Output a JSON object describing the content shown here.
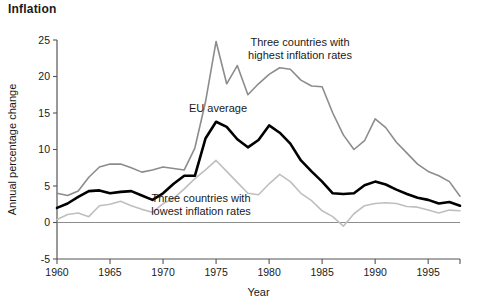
{
  "chart_data": {
    "type": "line",
    "title": "Inflation",
    "xlabel": "Year",
    "ylabel": "Annual percentage change",
    "xlim": [
      1960,
      1998
    ],
    "ylim": [
      -5,
      25
    ],
    "xticks": [
      1960,
      1965,
      1970,
      1975,
      1980,
      1985,
      1990,
      1995
    ],
    "xticklabels": [
      "1960",
      "1965",
      "1970",
      "1975",
      "1980",
      "1985",
      "1990",
      "1995"
    ],
    "yticks": [
      -5,
      0,
      5,
      10,
      15,
      20,
      25
    ],
    "yticklabels": [
      "-5",
      "0",
      "5",
      "10",
      "15",
      "20",
      "25"
    ],
    "grid": false,
    "legend_position": "inline-annotations",
    "zero_line": 0,
    "x": [
      1960,
      1961,
      1962,
      1963,
      1964,
      1965,
      1966,
      1967,
      1968,
      1969,
      1970,
      1971,
      1972,
      1973,
      1974,
      1975,
      1976,
      1977,
      1978,
      1979,
      1980,
      1981,
      1982,
      1983,
      1984,
      1985,
      1986,
      1987,
      1988,
      1989,
      1990,
      1991,
      1992,
      1993,
      1994,
      1995,
      1996,
      1997,
      1998
    ],
    "series": [
      {
        "name": "Three countries with highest inflation rates",
        "color": "#8c8c8c",
        "values": [
          4.0,
          3.7,
          4.3,
          6.2,
          7.6,
          8.0,
          8.0,
          7.5,
          6.9,
          7.2,
          7.6,
          7.4,
          7.2,
          10.2,
          16.5,
          24.8,
          19.0,
          21.5,
          17.5,
          19.0,
          20.3,
          21.2,
          21.0,
          19.5,
          18.7,
          18.6,
          15.0,
          12.0,
          10.0,
          11.2,
          14.2,
          13.0,
          11.0,
          9.5,
          8.0,
          7.0,
          6.4,
          5.6,
          3.6
        ]
      },
      {
        "name": "EU average",
        "color": "#000000",
        "values": [
          2.0,
          2.6,
          3.5,
          4.3,
          4.4,
          4.0,
          4.2,
          4.3,
          3.7,
          3.1,
          4.0,
          5.3,
          6.4,
          6.4,
          11.5,
          13.8,
          13.1,
          11.4,
          10.3,
          11.3,
          13.3,
          12.3,
          10.8,
          8.5,
          7.0,
          5.6,
          4.0,
          3.9,
          4.0,
          5.1,
          5.6,
          5.2,
          4.5,
          3.9,
          3.4,
          3.1,
          2.6,
          2.8,
          2.3
        ]
      },
      {
        "name": "Three countries with lowest inflation rates",
        "color": "#bfbfbf",
        "values": [
          0.4,
          1.1,
          1.3,
          0.8,
          2.3,
          2.5,
          2.9,
          2.3,
          1.8,
          1.4,
          2.6,
          3.3,
          4.6,
          6.0,
          7.2,
          8.5,
          7.0,
          5.5,
          4.0,
          3.8,
          5.3,
          6.6,
          5.6,
          4.0,
          3.0,
          1.6,
          0.8,
          -0.5,
          1.2,
          2.3,
          2.6,
          2.7,
          2.6,
          2.2,
          2.1,
          1.7,
          1.3,
          1.7,
          1.6
        ]
      }
    ],
    "annotations": [
      {
        "id": "annot-high",
        "lines": [
          "Three countries with",
          "highest inflation rates"
        ],
        "x_px": 300,
        "y_px": 46
      },
      {
        "id": "annot-eu",
        "lines": [
          "EU average"
        ],
        "x_px": 218,
        "y_px": 112
      },
      {
        "id": "annot-low",
        "lines": [
          "Three countries with",
          "lowest inflation rates"
        ],
        "x_px": 201,
        "y_px": 202
      }
    ]
  }
}
